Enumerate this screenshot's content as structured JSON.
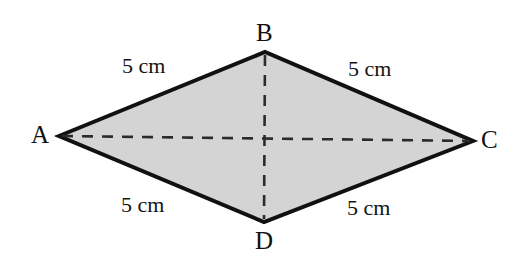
{
  "figure": {
    "type": "rhombus-diagram",
    "shape_name": "rhombus ABCD",
    "fill_color": "#d4d4d4",
    "stroke_color": "#111111",
    "dash_color": "#2b2b2b",
    "background_color": "#ffffff",
    "vertices": [
      {
        "id": "A",
        "label": "A",
        "x": 59,
        "y": 136
      },
      {
        "id": "B",
        "label": "B",
        "x": 265,
        "y": 52
      },
      {
        "id": "C",
        "label": "C",
        "x": 473,
        "y": 141
      },
      {
        "id": "D",
        "label": "D",
        "x": 264,
        "y": 222
      }
    ],
    "polygon_points": "59,136 265,52 473,141 264,222",
    "sides": [
      {
        "id": "AB",
        "from": "A",
        "to": "B",
        "label": "5 cm"
      },
      {
        "id": "BC",
        "from": "B",
        "to": "C",
        "label": "5 cm"
      },
      {
        "id": "AD",
        "from": "A",
        "to": "D",
        "label": "5 cm"
      },
      {
        "id": "DC",
        "from": "D",
        "to": "C",
        "label": "5 cm"
      }
    ],
    "diagonals": [
      {
        "id": "AC",
        "from": "A",
        "to": "C",
        "style": "dashed",
        "x1": 59,
        "y1": 136,
        "x2": 473,
        "y2": 141
      },
      {
        "id": "BD",
        "from": "B",
        "to": "D",
        "style": "dashed",
        "x1": 265,
        "y1": 52,
        "x2": 264,
        "y2": 222
      }
    ],
    "watermark_text": ""
  }
}
